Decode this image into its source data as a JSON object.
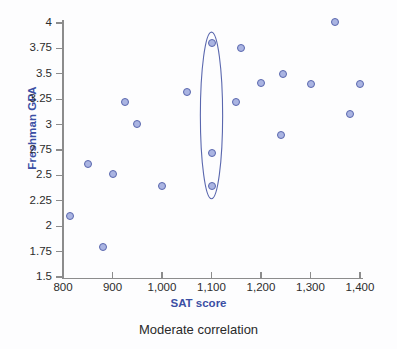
{
  "figure": {
    "caption": "Moderate correlation",
    "background_color": "#fdfdfe"
  },
  "colors": {
    "axis_title": "#3b4fa4",
    "tick_label": "#2c2c2c",
    "axis_line": "#8c8c8c",
    "point_fill": "#aab4e2",
    "point_stroke": "#5a67ae",
    "ellipse_stroke": "#5a67ae",
    "caption": "#2a2a2a"
  },
  "chart_data": {
    "type": "scatter",
    "title": "",
    "subtitle": "Moderate correlation",
    "xlabel": "SAT score",
    "ylabel": "Freshman GPA",
    "xlim": [
      800,
      1400
    ],
    "ylim": [
      1.5,
      4
    ],
    "grid": false,
    "legend": null,
    "xticks": [
      800,
      900,
      1000,
      1100,
      1200,
      1300,
      1400
    ],
    "xticklabels": [
      "800",
      "900",
      "1,000",
      "1,100",
      "1,200",
      "1,300",
      "1,400"
    ],
    "yticks": [
      1.5,
      1.75,
      2,
      2.25,
      2.5,
      2.75,
      3,
      3.25,
      3.5,
      3.75,
      4
    ],
    "yticklabels": [
      "1.5",
      "1.75",
      "2",
      "2.25",
      "2.5",
      "2.75",
      "3",
      "3.25",
      "3.5",
      "3.75",
      "4"
    ],
    "points": [
      {
        "x": 815,
        "y": 2.1
      },
      {
        "x": 850,
        "y": 2.61
      },
      {
        "x": 880,
        "y": 1.8
      },
      {
        "x": 900,
        "y": 2.51
      },
      {
        "x": 925,
        "y": 3.22
      },
      {
        "x": 950,
        "y": 3.01
      },
      {
        "x": 1000,
        "y": 2.4
      },
      {
        "x": 1050,
        "y": 3.32
      },
      {
        "x": 1100,
        "y": 3.8
      },
      {
        "x": 1100,
        "y": 2.72
      },
      {
        "x": 1100,
        "y": 2.4
      },
      {
        "x": 1150,
        "y": 3.22
      },
      {
        "x": 1160,
        "y": 3.75
      },
      {
        "x": 1200,
        "y": 3.41
      },
      {
        "x": 1240,
        "y": 2.9
      },
      {
        "x": 1245,
        "y": 3.5
      },
      {
        "x": 1300,
        "y": 3.4
      },
      {
        "x": 1350,
        "y": 4.01
      },
      {
        "x": 1380,
        "y": 3.1
      },
      {
        "x": 1400,
        "y": 3.4
      }
    ],
    "annotations": [
      {
        "kind": "ellipse",
        "name": "vertical-spread-highlight",
        "center_x": 1100,
        "center_y": 3.09,
        "width_x": 45,
        "height_y": 1.64
      }
    ]
  }
}
